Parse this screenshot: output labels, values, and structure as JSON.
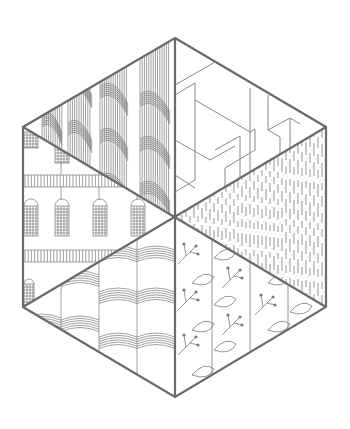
{
  "illustration": {
    "title": "Hexagon pattern illustration",
    "stroke_color": "#6b6b6b",
    "fine_color": "#7a7a7a",
    "background": "#ffffff",
    "hexagon": {
      "center": [
        175,
        217
      ],
      "vertices": [
        [
          175,
          38
        ],
        [
          326,
          127
        ],
        [
          326,
          307
        ],
        [
          175,
          397
        ],
        [
          23,
          307
        ],
        [
          23,
          127
        ]
      ]
    },
    "segments": [
      {
        "id": "top-left",
        "pattern": "braided-rope"
      },
      {
        "id": "top-right",
        "pattern": "geometric-folds"
      },
      {
        "id": "right",
        "pattern": "dashed-rain"
      },
      {
        "id": "bottom-right",
        "pattern": "berry-branches-and-leaves"
      },
      {
        "id": "bottom-left",
        "pattern": "wave-arcs"
      },
      {
        "id": "left",
        "pattern": "building-facade-arched-windows"
      }
    ]
  }
}
